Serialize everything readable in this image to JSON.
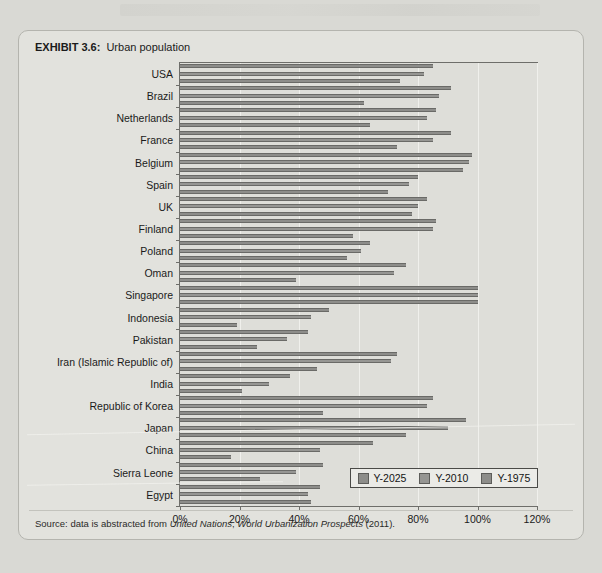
{
  "figure": {
    "exhibit_number": "EXHIBIT 3.6:",
    "title": "Urban population",
    "source": "Source: data is abstracted from ",
    "source_italic_1": "United Nations",
    "source_mid": ", ",
    "source_italic_2": "World Urbanization Prospects",
    "source_end": " (2011)."
  },
  "legend": {
    "items": [
      {
        "label": "Y-2025",
        "color": "#8d8d8a"
      },
      {
        "label": "Y-2010",
        "color": "#969693"
      },
      {
        "label": "Y-1975",
        "color": "#8d8d8a"
      }
    ]
  },
  "chart_data": {
    "type": "bar",
    "orientation": "horizontal",
    "title": "Urban population",
    "xlabel": "",
    "ylabel": "",
    "xlim": [
      0,
      120
    ],
    "xunit": "%",
    "xticks": [
      "0%",
      "20%",
      "40%",
      "60%",
      "80%",
      "100%",
      "120%"
    ],
    "xtick_values": [
      0,
      20,
      40,
      60,
      80,
      100,
      120
    ],
    "grid": true,
    "legend_position": "bottom-right",
    "categories": [
      "USA",
      "Brazil",
      "Netherlands",
      "France",
      "Belgium",
      "Spain",
      "UK",
      "Finland",
      "Poland",
      "Oman",
      "Singapore",
      "Indonesia",
      "Pakistan",
      "Iran (Islamic Republic of)",
      "India",
      "Republic of Korea",
      "Japan",
      "China",
      "Sierra Leone",
      "Egypt"
    ],
    "series": [
      {
        "name": "Y-2025",
        "values": [
          85,
          91,
          86,
          91,
          98,
          80,
          83,
          86,
          64,
          76,
          100,
          50,
          43,
          73,
          37,
          85,
          96,
          65,
          48,
          47
        ]
      },
      {
        "name": "Y-2010",
        "values": [
          82,
          87,
          83,
          85,
          97,
          77,
          80,
          85,
          61,
          72,
          100,
          44,
          36,
          71,
          30,
          83,
          90,
          47,
          39,
          43
        ]
      },
      {
        "name": "Y-1975",
        "values": [
          74,
          62,
          64,
          73,
          95,
          70,
          78,
          58,
          56,
          39,
          100,
          19,
          26,
          46,
          21,
          48,
          76,
          17,
          27,
          44
        ]
      }
    ]
  },
  "ghost_text": {
    "line_a": "",
    "line_b": "",
    "line_c": "",
    "line_d": ""
  }
}
